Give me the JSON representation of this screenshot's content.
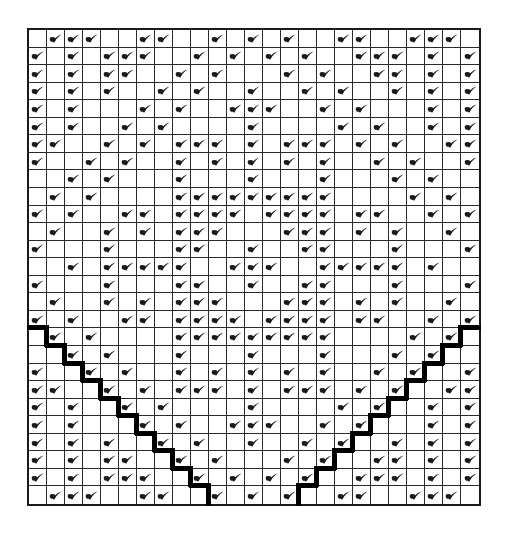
{
  "diagram": {
    "type": "checkmark-grid",
    "columns": 25,
    "rows": 27,
    "legend": {
      "x": "check-mark",
      ".": "empty"
    },
    "ink_color": "#1a1a1a",
    "background_color": "#ffffff",
    "grid": [
      ".xxx..xx..x.x.x..xx..xxx.",
      "x.x.xxx..x.x.x.x..xxx.x.x",
      "x.x.xx..x.x...x.x..xx.x.x",
      "x.x.x..x.x..x..x.x..x.x.x",
      "x.x...x.x..xxx..x.x...x.x",
      "x.x..x.x....x....x.x..x.x",
      "xx..x.x.xxx.x.xxx.x.x..xx",
      "x..x.x..x.x.x.x.x..x.x..x",
      "..x.x...x...x...x...x.x..",
      ".x.x....xxxxxxxxx....x.x.",
      "x.x..xx.xxxx.xxxx.xx..x.x",
      ".x..x.x.xxx...xxx.x.x..x.",
      "x...x...xx..x..xx...x...x",
      "..x.xxxxx..xxx..xxxxx.x..",
      "x...x...xx..x..xx...x...x",
      ".x..x.x.xxx...xxx.x.x..x.",
      "x.x..xx.xxxx.xxxx.xx..x.x",
      ".x.x....xxxxxxxxx....x.x.",
      "..x.x...x...x...x...x.x..",
      "x..x.x..x.x.x.x.x..x.x..x",
      "xx..x.x.xxx.x.xxx.x.x..xx",
      "x.x..x.x....x....x.x..x.x",
      "x.x...x.x..xxx..x.x...x.x",
      "x.x.x..x.x..x..x.x..x.x.x",
      "x.x.xx..x.x...x.x..xx.x.x",
      "x.x.xxx..x.x.x.x..xxx.x.x",
      ".xxx..xx..x.x.x..xx..xxx."
    ],
    "staircases": [
      {
        "name": "left-staircase",
        "description": "thick line along top and right edge of one cell per row",
        "start_row": 18,
        "start_col": 1,
        "direction": "down-right",
        "steps": 10
      },
      {
        "name": "right-staircase",
        "description": "thick line along top and left edge of one cell per row",
        "start_row": 18,
        "start_col": 25,
        "direction": "down-left",
        "steps": 10
      }
    ]
  }
}
